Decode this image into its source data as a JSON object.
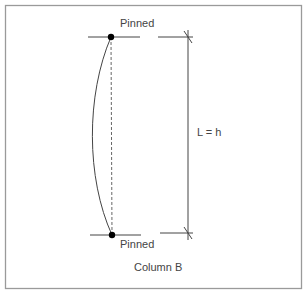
{
  "diagram": {
    "title": "Column B",
    "top_support": {
      "label": "Pinned",
      "type": "pinned",
      "node": [
        111,
        37
      ]
    },
    "bottom_support": {
      "label": "Pinned",
      "type": "pinned",
      "node": [
        112,
        235
      ]
    },
    "length_dimension": {
      "label": "L = h"
    },
    "elements": {
      "frame": {
        "x": 5.5,
        "y": 5.5,
        "w": 296,
        "h": 283
      },
      "top_support_line": {
        "x1": 88,
        "y1": 37,
        "x2": 140,
        "y2": 37
      },
      "bottom_support_line": {
        "x1": 90,
        "y1": 235,
        "x2": 141,
        "y2": 235
      },
      "dashed_axis": {
        "x1": 111,
        "y1": 37,
        "x2": 112,
        "y2": 235
      },
      "buckled_shape_path": "M111 37 C 86 95, 86 178, 112 235",
      "dim_ext_top": {
        "x1": 158,
        "y1": 37,
        "x2": 193,
        "y2": 37
      },
      "dim_ext_bottom": {
        "x1": 160,
        "y1": 233,
        "x2": 193,
        "y2": 233
      },
      "dim_line": {
        "x1": 188,
        "y1": 30,
        "x2": 188,
        "y2": 240
      },
      "tick_top": {
        "x1": 184,
        "y1": 31,
        "x2": 192,
        "y2": 43
      },
      "tick_bottom": {
        "x1": 184,
        "y1": 227,
        "x2": 192,
        "y2": 239
      },
      "label_positions": {
        "top_pinned": [
          120,
          27
        ],
        "bottom_pinned": [
          120,
          248
        ],
        "length": [
          197,
          136
        ],
        "title": [
          134,
          271
        ]
      }
    },
    "colors": {
      "frame": "#9a9a9a",
      "lines": "#444444",
      "node": "#000000",
      "text": "#444444",
      "dashed": "#666666"
    }
  }
}
